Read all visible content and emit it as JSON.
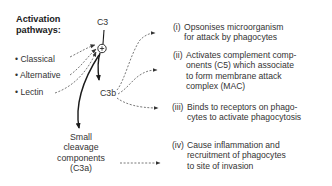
{
  "diagram": {
    "title_lines": [
      "Activation",
      "pathways:"
    ],
    "pathways": [
      {
        "bullet": "•",
        "label": "Classical"
      },
      {
        "bullet": "•",
        "label": "Alternative"
      },
      {
        "bullet": "•",
        "label": "Lectin"
      }
    ],
    "nodes": {
      "c3": "C3",
      "plus": "+",
      "c3b": "C3b",
      "c3a_lines": [
        "Small",
        "cleavage",
        "components",
        "(C3a)"
      ]
    },
    "outcomes": [
      {
        "num": "(i)",
        "lines": [
          "Opsonises microorganism",
          "for attack by phagocytes"
        ]
      },
      {
        "num": "(ii)",
        "lines": [
          "Activates complement comp-",
          "onents (C5) which associate",
          "to form membrane attack",
          "complex (MAC)"
        ]
      },
      {
        "num": "(iii)",
        "lines": [
          "Binds to receptors on phago-",
          "cytes to activate phagocytosis"
        ]
      },
      {
        "num": "(iv)",
        "lines": [
          "Cause inflammation and",
          "recruitment of phagocytes",
          "to site of invasion"
        ]
      }
    ],
    "colors": {
      "line": "#1a1a1a",
      "dashed": "#555555",
      "text": "#333333"
    }
  }
}
